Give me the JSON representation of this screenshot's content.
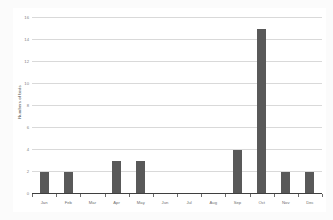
{
  "chart_data": {
    "type": "bar",
    "title": "",
    "xlabel": "",
    "ylabel": "Numbers of birds",
    "categories": [
      "Jan",
      "Feb",
      "Mar",
      "Apr",
      "May",
      "Jun",
      "Jul",
      "Aug",
      "Sep",
      "Oct",
      "Nov",
      "Dec"
    ],
    "values": [
      2,
      2,
      0,
      3,
      3,
      0,
      0,
      0,
      4,
      15,
      2,
      2
    ],
    "ylim": [
      0,
      16
    ],
    "yticks": [
      0,
      2,
      4,
      6,
      8,
      10,
      12,
      14,
      16
    ],
    "ytick_labels": [
      "0",
      "2",
      "4",
      "6",
      "8",
      "10",
      "12",
      "14",
      "16"
    ],
    "grid": true,
    "legend": false,
    "legend_position": "none",
    "series": [
      {
        "name": "Numbers of birds",
        "values": [
          2,
          2,
          0,
          3,
          3,
          0,
          0,
          0,
          4,
          15,
          2,
          2
        ]
      }
    ],
    "colors": {
      "bar": "#595959",
      "gridline": "#d9d9d9",
      "axis": "#3f3f3f",
      "tick_text": "#808080",
      "plot_background": "#ffffff",
      "figure_background": "#fbfbfb"
    }
  }
}
